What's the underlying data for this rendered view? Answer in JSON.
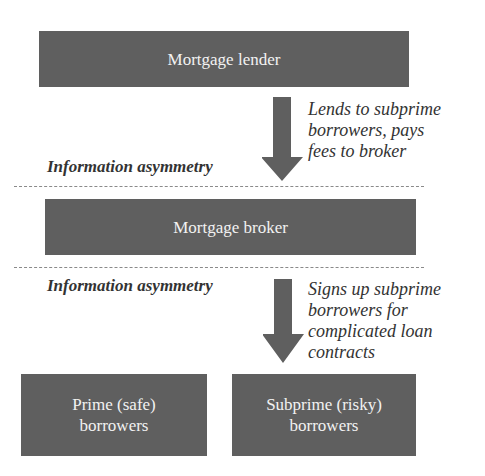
{
  "diagram": {
    "nodes": {
      "lender": {
        "label": "Mortgage lender"
      },
      "broker": {
        "label": "Mortgage broker"
      },
      "prime": {
        "line1": "Prime (safe)",
        "line2": "borrowers"
      },
      "subprime": {
        "line1": "Subprime (risky)",
        "line2": "borrowers"
      }
    },
    "edges": {
      "lender_to_broker": {
        "lines": [
          "Lends to subprime",
          "borrowers, pays",
          "fees to broker"
        ]
      },
      "broker_to_subprime": {
        "lines": [
          "Signs up subprime",
          "borrowers for",
          "complicated loan",
          "contracts"
        ]
      }
    },
    "boundaries": {
      "upper": {
        "label": "Information asymmetry"
      },
      "lower": {
        "label": "Information asymmetry"
      }
    },
    "colors": {
      "box_fill": "#5f5f5f",
      "box_text": "#f2f2f2",
      "arrow": "#5f5f5f",
      "dash": "#8a8a8a"
    }
  }
}
